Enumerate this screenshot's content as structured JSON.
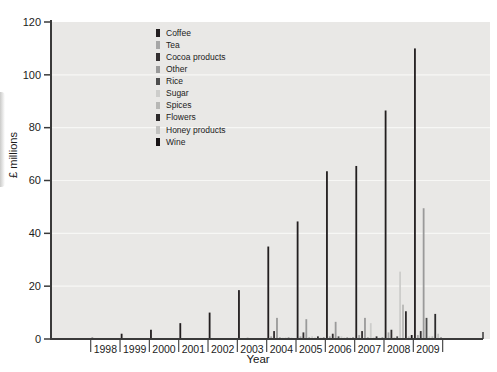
{
  "chart_data": {
    "type": "bar",
    "title": "",
    "xlabel": "Year",
    "ylabel": "£ millions",
    "ylim": [
      0,
      120
    ],
    "yticks": [
      0,
      20,
      40,
      60,
      80,
      100,
      120
    ],
    "grid": "subtle horizontal white gridlines every 20",
    "legend_position": "inside plot, upper-left-center, vertical list",
    "plot_bg_color": "#e9e8e6",
    "gridline_color": "#f7f7f5",
    "axis_color": "#3a3a3a",
    "text_color": "#1c1c1c",
    "categories": [
      "1998",
      "1999",
      "2000",
      "2001",
      "2002",
      "2003",
      "2004",
      "2005",
      "2006",
      "2007",
      "2008",
      "2009"
    ],
    "series": [
      {
        "name": "Coffee",
        "color": "#221e1f",
        "values": [
          0.5,
          2,
          3.5,
          6,
          10,
          18.5,
          35,
          44.5,
          63.5,
          65.5,
          86.5,
          110
        ]
      },
      {
        "name": "Tea",
        "color": "#a6a6a6",
        "values": [
          0,
          0,
          0,
          0,
          0,
          0,
          1,
          1,
          1,
          1.5,
          2.5,
          1.5
        ]
      },
      {
        "name": "Cocoa products",
        "color": "#332f30",
        "values": [
          0,
          0,
          0,
          0,
          0,
          0,
          3,
          2.5,
          2,
          3,
          3.5,
          3
        ]
      },
      {
        "name": "Other",
        "color": "#9a9a9a",
        "values": [
          0,
          0,
          0,
          0,
          0,
          0.5,
          8,
          7.5,
          6.5,
          8,
          0.5,
          49.5
        ]
      },
      {
        "name": "Rice",
        "color": "#4d4d4d",
        "values": [
          0,
          0,
          0,
          0,
          0,
          0,
          0.5,
          0.5,
          1,
          0.5,
          1,
          8
        ]
      },
      {
        "name": "Sugar",
        "color": "#cdcdcb",
        "values": [
          0,
          0,
          0,
          0,
          0,
          0,
          0.5,
          1,
          1,
          6,
          25.5,
          1
        ]
      },
      {
        "name": "Spices",
        "color": "#b7b7b5",
        "values": [
          0,
          0,
          0,
          0,
          0,
          0,
          0.5,
          0.5,
          0.5,
          0.5,
          13,
          1
        ]
      },
      {
        "name": "Flowers",
        "color": "#2c2a2b",
        "values": [
          0,
          0,
          0,
          0,
          0,
          0,
          0.5,
          1,
          0.5,
          1,
          10.5,
          9.5
        ]
      },
      {
        "name": "Honey products",
        "color": "#c2c2c0",
        "values": [
          0,
          0,
          0,
          0,
          0,
          0,
          0.5,
          0.5,
          0.5,
          0.5,
          1,
          2
        ]
      },
      {
        "name": "Wine",
        "color": "#171314",
        "values": [
          0,
          0,
          0,
          0,
          0,
          0,
          0,
          0.5,
          0.5,
          0.5,
          1.5,
          0.5
        ]
      }
    ]
  }
}
